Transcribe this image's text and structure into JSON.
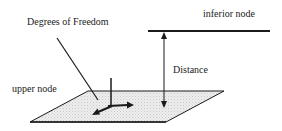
{
  "diagram": {
    "labels": {
      "degrees_of_freedom": "Degrees of Freedom",
      "inferior_node": "inferior node",
      "distance": "Distance",
      "upper_node": "upper node"
    },
    "colors": {
      "line": "#1a1a1a",
      "plane_fill": "#e6e6e6",
      "text": "#222222",
      "background": "#ffffff"
    },
    "elements": {
      "inferior_node_line": "horizontal line representing inferior node",
      "distance_arrow": "vertical double-headed arrow between nodes",
      "upper_node_plane": "shaded parallelogram representing upper node",
      "dof_axes": "three-axis arrow glyph on plane",
      "dof_pointer": "leader line from label to axes"
    }
  }
}
